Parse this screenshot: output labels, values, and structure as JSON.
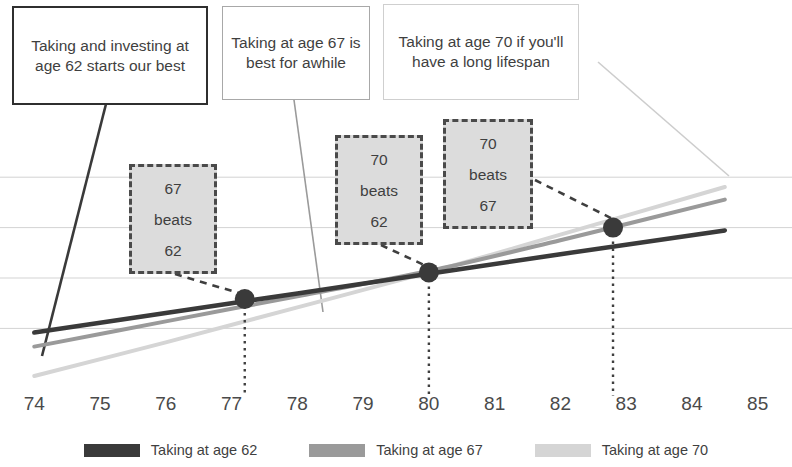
{
  "chart_data": {
    "type": "line",
    "title": "",
    "xlabel": "",
    "ylabel": "",
    "xlim": [
      73.6,
      85.4
    ],
    "ylim": [
      0,
      100
    ],
    "xticks": [
      "74",
      "75",
      "76",
      "77",
      "78",
      "79",
      "80",
      "81",
      "82",
      "83",
      "84",
      "85"
    ],
    "grid": true,
    "gridlines_y": [
      22,
      40,
      58,
      76
    ],
    "legend_position": "bottom",
    "series": [
      {
        "name": "Taking at age 62",
        "color": "#3a3a3a",
        "x": [
          74.0,
          76.0,
          78.0,
          80.0,
          82.0,
          84.5
        ],
        "y": [
          20.5,
          27.5,
          34.5,
          41.5,
          48.5,
          57.0
        ]
      },
      {
        "name": "Taking at age 67",
        "color": "#9a9a9a",
        "x": [
          74.0,
          76.0,
          78.0,
          80.0,
          82.0,
          84.5
        ],
        "y": [
          15.5,
          24.5,
          33.5,
          42.5,
          53.5,
          68.0
        ]
      },
      {
        "name": "Taking at age 70",
        "color": "#d5d5d5",
        "x": [
          74.0,
          76.0,
          78.0,
          80.0,
          82.0,
          84.5
        ],
        "y": [
          5.0,
          17.0,
          29.5,
          42.0,
          55.5,
          72.5
        ]
      }
    ],
    "crossover_points": [
      {
        "label": "67 beats 62",
        "x": 77.2,
        "y": 32.5
      },
      {
        "label": "70 beats 62",
        "x": 80.0,
        "y": 42.0
      },
      {
        "label": "70 beats 67",
        "x": 82.8,
        "y": 58.0
      }
    ]
  },
  "callouts": [
    {
      "id": "callout-62",
      "text": "Taking and investing at age 62 starts our best"
    },
    {
      "id": "callout-67",
      "text": "Taking at age 67 is best for awhile"
    },
    {
      "id": "callout-70",
      "text": "Taking at age 70 if you'll have a long lifespan"
    }
  ],
  "notes": [
    {
      "line1": "67",
      "line2": "beats",
      "line3": "62"
    },
    {
      "line1": "70",
      "line2": "beats",
      "line3": "62"
    },
    {
      "line1": "70",
      "line2": "beats",
      "line3": "67"
    }
  ],
  "legend": [
    {
      "label": "Taking at age 62",
      "color": "#3a3a3a"
    },
    {
      "label": "Taking at age 67",
      "color": "#9a9a9a"
    },
    {
      "label": "Taking at age 70",
      "color": "#d5d5d5"
    }
  ],
  "colors": {
    "gridline": "#d3d3d3",
    "marker": "#3a3a3a",
    "note_fill": "#dcdcdc",
    "note_border": "#4a4a4a",
    "text": "#3f3f3f"
  }
}
